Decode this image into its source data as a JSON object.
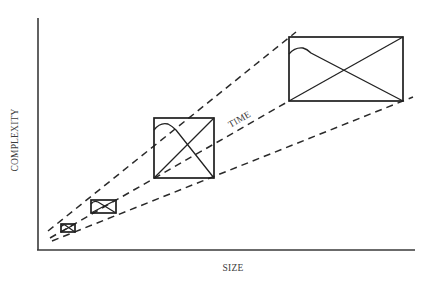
{
  "diagram": {
    "y_axis_label": "COMPLEXITY",
    "x_axis_label": "SIZE",
    "trend_label": "TIME",
    "boxes": [
      {
        "name": "stage-1",
        "x": 61,
        "y": 224,
        "w": 14,
        "h": 8
      },
      {
        "name": "stage-2",
        "x": 91,
        "y": 200,
        "w": 25,
        "h": 13
      },
      {
        "name": "stage-3",
        "x": 154,
        "y": 118,
        "w": 60,
        "h": 60
      },
      {
        "name": "stage-4",
        "x": 289,
        "y": 37,
        "w": 114,
        "h": 64
      }
    ],
    "colors": {
      "background": "#ffffff",
      "ink": "#222222",
      "axis": "#3a3a3a"
    }
  }
}
